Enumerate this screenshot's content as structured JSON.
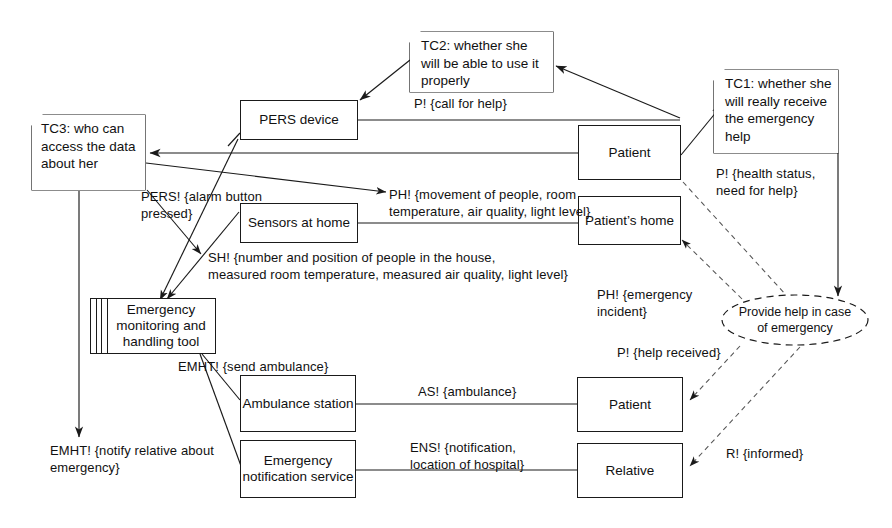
{
  "diagram": {
    "background": "#ffffff",
    "stroke": "#1a1a1a"
  },
  "notes": [
    {
      "id": "TC3",
      "text": "TC3: who can access the data about her"
    },
    {
      "id": "TC2",
      "text": "TC2: whether she will be able to use it properly"
    },
    {
      "id": "TC1",
      "text": "TC1: whether she will really receive the emergency help"
    }
  ],
  "boxes": [
    {
      "id": "pers-device",
      "label": "PERS device"
    },
    {
      "id": "sensors-at-home",
      "label": "Sensors at home"
    },
    {
      "id": "emht",
      "label": "Emergency monitoring and handling tool",
      "component": true
    },
    {
      "id": "ambulance-station",
      "label": "Ambulance station"
    },
    {
      "id": "emergency-notification-service",
      "label": "Emergency notification service"
    },
    {
      "id": "patient-top",
      "label": "Patient"
    },
    {
      "id": "patients-home",
      "label": "Patient’s home"
    },
    {
      "id": "patient-bottom",
      "label": "Patient"
    },
    {
      "id": "relative",
      "label": "Relative"
    }
  ],
  "requirement": {
    "id": "provide-help",
    "text": "Provide help in case of emergency"
  },
  "edge_labels": [
    {
      "id": "call-for-help",
      "text": "P! {call for help}"
    },
    {
      "id": "pers-alarm-button",
      "text": "PERS! {alarm button\npressed}"
    },
    {
      "id": "ph-movement",
      "text": "PH! {movement of people, room\ntemperature, air quality, light level}"
    },
    {
      "id": "sh-number-position",
      "text": "SH! {number and position of people in the house,\nmeasured room temperature, measured air quality, light level}"
    },
    {
      "id": "p-health-status",
      "text": "P! {health status,\nneed for help}"
    },
    {
      "id": "ph-emergency-incident",
      "text": "PH! {emergency\nincident}"
    },
    {
      "id": "p-help-received",
      "text": "P! {help received}"
    },
    {
      "id": "emht-send-ambulance",
      "text": "EMHT! {send ambulance}"
    },
    {
      "id": "emht-notify-relative",
      "text": "EMHT! {notify relative about\nemergency}"
    },
    {
      "id": "as-ambulance",
      "text": "AS! {ambulance}"
    },
    {
      "id": "ens-notification",
      "text": "ENS! {notification,\nlocation of hospital}"
    },
    {
      "id": "r-informed",
      "text": "R! {informed}"
    }
  ]
}
